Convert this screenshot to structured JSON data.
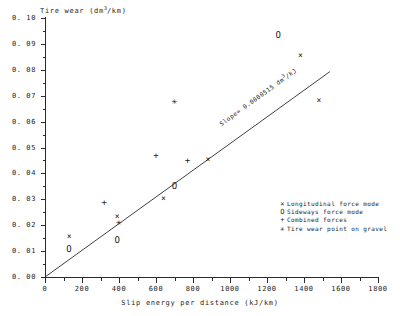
{
  "chart_data": {
    "type": "scatter",
    "title": "",
    "xlabel": "Slip energy per distance (kJ/km)",
    "ylabel": "Tire wear (dm3/km)",
    "ylabel_parts": {
      "pre": "Tire wear (dm",
      "sup": "3",
      "post": "/km)"
    },
    "xlim": [
      0,
      1800
    ],
    "ylim": [
      0.0,
      0.1
    ],
    "grid": false,
    "x_ticks": [
      0,
      200,
      400,
      600,
      800,
      1000,
      1200,
      1400,
      1600,
      1800
    ],
    "x_tick_labels": [
      "0",
      "200",
      "400",
      "600",
      "800",
      "1000",
      "1200",
      "1400",
      "1600",
      "1800"
    ],
    "y_ticks": [
      0.0,
      0.01,
      0.02,
      0.03,
      0.04,
      0.05,
      0.06,
      0.07,
      0.08,
      0.09,
      0.1
    ],
    "y_tick_labels": [
      "0. 00",
      "0. 01",
      "0. 02",
      "0. 03",
      "0. 04",
      "0. 05",
      "0. 06",
      "0. 07",
      "0. 08",
      "0. 09",
      "0. 10"
    ],
    "legend_position": "lower-right",
    "series": [
      {
        "name": "Longitudinal force mode",
        "marker": "x",
        "glyph": "×",
        "points": [
          {
            "x": 130,
            "y": 0.0155
          },
          {
            "x": 390,
            "y": 0.0232
          },
          {
            "x": 640,
            "y": 0.03
          },
          {
            "x": 880,
            "y": 0.045
          },
          {
            "x": 1380,
            "y": 0.0855
          },
          {
            "x": 1480,
            "y": 0.068
          }
        ]
      },
      {
        "name": "Sideways force mode",
        "marker": "o",
        "glyph": "O",
        "points": [
          {
            "x": 130,
            "y": 0.0108
          },
          {
            "x": 390,
            "y": 0.0142
          },
          {
            "x": 700,
            "y": 0.0352
          },
          {
            "x": 1260,
            "y": 0.0935
          }
        ]
      },
      {
        "name": "Combined forces",
        "marker": "+",
        "glyph": "+",
        "points": [
          {
            "x": 320,
            "y": 0.029
          },
          {
            "x": 600,
            "y": 0.047
          },
          {
            "x": 770,
            "y": 0.0452
          }
        ]
      },
      {
        "name": "Tire wear point on gravel",
        "marker": "*",
        "glyph": "✳",
        "points": [
          {
            "x": 700,
            "y": 0.068
          },
          {
            "x": 400,
            "y": 0.0212
          }
        ]
      }
    ],
    "fit_line": {
      "label": "Slope= 0.0000515 dm3/kJ",
      "slope": 5.15e-05,
      "intercept": 0.0,
      "x_start": 0,
      "x_end": 1540,
      "y_start": 0.0,
      "y_end": 0.0793
    }
  },
  "legend": {
    "items": [
      {
        "glyph": "×",
        "label": "Longitudinal force mode"
      },
      {
        "glyph": "O",
        "label": "Sideways force mode"
      },
      {
        "glyph": "+",
        "label": "Combined forces"
      },
      {
        "glyph": "✳",
        "label": "Tire wear point on gravel"
      }
    ]
  }
}
